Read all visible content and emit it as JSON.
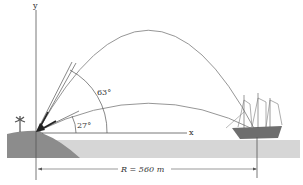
{
  "figure": {
    "axis_y_label": "y",
    "axis_x_label": "x",
    "angle_high": "63°",
    "angle_low": "27°",
    "range_label": "R = 560 m"
  },
  "colors": {
    "land": "#8c8c8c",
    "water": "#d6d6d6",
    "trajectory": "#8a8a8a",
    "ship_hull": "#6e6e6e",
    "lines": "#555555"
  }
}
